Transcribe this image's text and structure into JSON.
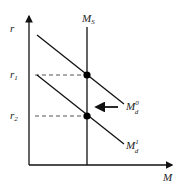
{
  "diagram": {
    "axes": {
      "y_label": "r",
      "x_label": "M"
    },
    "supply_label": {
      "main": "M",
      "sub": "S"
    },
    "rates": [
      {
        "main": "r",
        "sub": "1"
      },
      {
        "main": "r",
        "sub": "2"
      }
    ],
    "demand_curves": [
      {
        "main": "M",
        "sub": "d",
        "sup": "0"
      },
      {
        "main": "M",
        "sub": "d",
        "sup": "1"
      }
    ],
    "shift_direction": "left",
    "colors": {
      "line": "#111111",
      "dash": "#555555"
    }
  }
}
